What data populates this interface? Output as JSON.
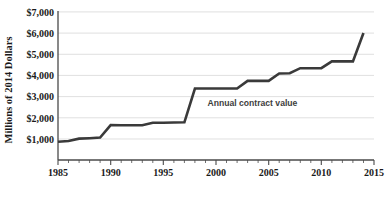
{
  "chart_data": {
    "type": "line",
    "title": "",
    "subtitle": "",
    "xlabel": "",
    "ylabel": "Millions of 2014 Dollars",
    "xlim": [
      1985,
      2015
    ],
    "ylim": [
      0,
      7000
    ],
    "grid": true,
    "legend_position": "inline-annotation",
    "y_tick_labels": [
      "$1,000",
      "$2,000",
      "$3,000",
      "$4,000",
      "$5,000",
      "$6,000",
      "$7,000"
    ],
    "y_tick_values": [
      1000,
      2000,
      3000,
      4000,
      5000,
      6000,
      7000
    ],
    "x_tick_labels": [
      "1985",
      "1990",
      "1995",
      "2000",
      "2005",
      "2010",
      "2015"
    ],
    "x_tick_values": [
      1985,
      1990,
      1995,
      2000,
      2005,
      2010,
      2015
    ],
    "x_minor_tick_interval": 1,
    "annotations": [
      {
        "text": "Annual contract value",
        "x": 1999.2,
        "y": 2560
      }
    ],
    "series": [
      {
        "name": "Annual contract value",
        "color": "#3a3a3a",
        "x": [
          1985,
          1986,
          1987,
          1988,
          1989,
          1990,
          1991,
          1992,
          1993,
          1994,
          1995,
          1996,
          1997,
          1998,
          1999,
          2000,
          2001,
          2002,
          2003,
          2004,
          2005,
          2006,
          2007,
          2008,
          2009,
          2010,
          2011,
          2012,
          2013,
          2014
        ],
        "values": [
          860,
          900,
          1010,
          1030,
          1060,
          1650,
          1640,
          1640,
          1640,
          1760,
          1760,
          1770,
          1780,
          3380,
          3380,
          3380,
          3380,
          3380,
          3740,
          3740,
          3740,
          4090,
          4100,
          4340,
          4340,
          4340,
          4660,
          4660,
          4660,
          6000
        ]
      }
    ]
  },
  "axes": {
    "y_axis_title": "Millions of 2014 Dollars"
  },
  "caption": {
    "text": ""
  }
}
